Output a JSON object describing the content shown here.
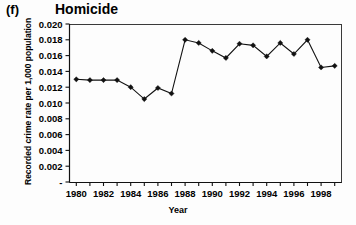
{
  "panel": {
    "label": "(f)",
    "title": "Homicide"
  },
  "chart_data": {
    "type": "line",
    "title": "Homicide",
    "panel_label": "(f)",
    "xlabel": "Year",
    "ylabel": "Recorded crime rate per 1,000 population",
    "xlim": [
      1979.5,
      1999.5
    ],
    "ylim": [
      0,
      0.02
    ],
    "grid": false,
    "legend": null,
    "marker": "filled-diamond",
    "y_ticks": [
      0,
      0.002,
      0.004,
      0.006,
      0.008,
      0.01,
      0.012,
      0.014,
      0.016,
      0.018,
      0.02
    ],
    "y_tick_labels": [
      "-",
      "0.002",
      "0.004",
      "0.006",
      "0.008",
      "0.010",
      "0.012",
      "0.014",
      "0.016",
      "0.018",
      "0.020"
    ],
    "x_ticks": [
      1980,
      1981,
      1982,
      1983,
      1984,
      1985,
      1986,
      1987,
      1988,
      1989,
      1990,
      1991,
      1992,
      1993,
      1994,
      1995,
      1996,
      1997,
      1998,
      1999
    ],
    "x_tick_labels": [
      "1980",
      "",
      "1982",
      "",
      "1984",
      "",
      "1986",
      "",
      "1988",
      "",
      "1990",
      "",
      "1992",
      "",
      "1994",
      "",
      "1996",
      "",
      "1998",
      ""
    ],
    "x": [
      1980,
      1981,
      1982,
      1983,
      1984,
      1985,
      1986,
      1987,
      1988,
      1989,
      1990,
      1991,
      1992,
      1993,
      1994,
      1995,
      1996,
      1997,
      1998,
      1999
    ],
    "values": [
      0.013,
      0.0129,
      0.0129,
      0.0129,
      0.012,
      0.0105,
      0.0119,
      0.0112,
      0.018,
      0.0176,
      0.0166,
      0.0157,
      0.0175,
      0.0173,
      0.0159,
      0.0176,
      0.0162,
      0.018,
      0.0145,
      0.0147
    ],
    "series": [
      {
        "name": "Homicide",
        "values": [
          0.013,
          0.0129,
          0.0129,
          0.0129,
          0.012,
          0.0105,
          0.0119,
          0.0112,
          0.018,
          0.0176,
          0.0166,
          0.0157,
          0.0175,
          0.0173,
          0.0159,
          0.0176,
          0.0162,
          0.018,
          0.0145,
          0.0147
        ]
      }
    ]
  },
  "colors": {
    "line": "#111111",
    "marker": "#111111",
    "frame": "#3a3a3a",
    "background": "#fdfdfd"
  }
}
